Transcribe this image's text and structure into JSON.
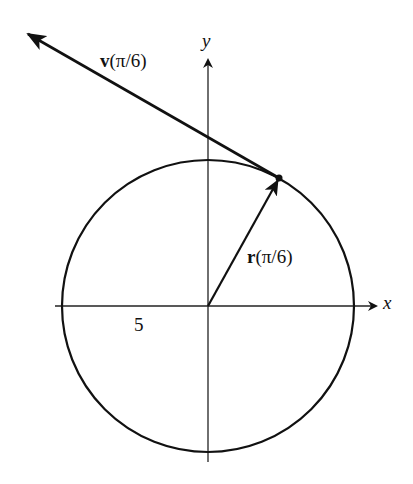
{
  "diagram": {
    "axes": {
      "x_label": "x",
      "y_label": "y"
    },
    "circle": {
      "radius_label": "5"
    },
    "vectors": {
      "position": {
        "name": "r",
        "arg": "(π/6)"
      },
      "velocity": {
        "name": "v",
        "arg": "(π/6)"
      }
    }
  }
}
